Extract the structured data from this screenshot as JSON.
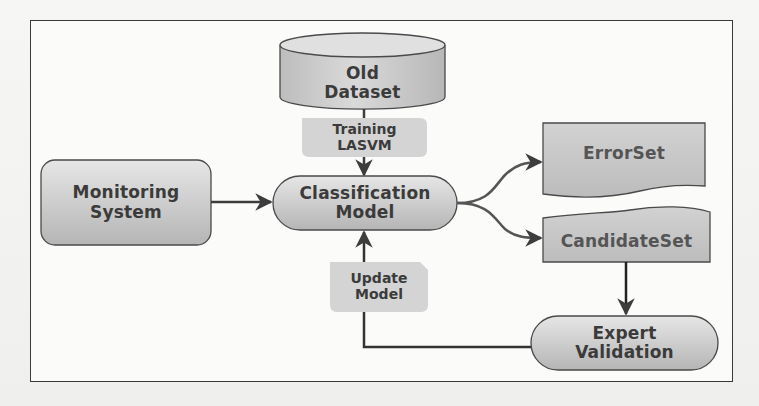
{
  "diagram": {
    "type": "flowchart",
    "nodes": {
      "old_dataset": {
        "line1": "Old",
        "line2": "Dataset",
        "shape": "cylinder"
      },
      "training": {
        "line1": "Training",
        "line2": "LASVM",
        "shape": "edge-label"
      },
      "monitoring": {
        "line1": "Monitoring",
        "line2": "System",
        "shape": "rounded-rectangle"
      },
      "classification": {
        "line1": "Classification",
        "line2": "Model",
        "shape": "stadium"
      },
      "errorset": {
        "line1": "ErrorSet",
        "shape": "document"
      },
      "candidateset": {
        "line1": "CandidateSet",
        "shape": "wavy-top-rectangle"
      },
      "expert": {
        "line1": "Expert",
        "line2": "Validation",
        "shape": "stadium"
      },
      "update": {
        "line1": "Update",
        "line2": "Model",
        "shape": "edge-label"
      }
    },
    "edges": [
      {
        "from": "Old Dataset",
        "to": "Classification Model",
        "label": "Training LASVM"
      },
      {
        "from": "Monitoring System",
        "to": "Classification Model"
      },
      {
        "from": "Classification Model",
        "to": "ErrorSet"
      },
      {
        "from": "Classification Model",
        "to": "CandidateSet"
      },
      {
        "from": "CandidateSet",
        "to": "Expert Validation"
      },
      {
        "from": "Expert Validation",
        "to": "Classification Model",
        "label": "Update Model"
      }
    ],
    "colors": {
      "node_fill_light": "#e2e2e2",
      "node_fill_dark": "#b8b8b8",
      "label_fill": "#d6d6d6",
      "stroke": "#4a4a4a",
      "text": "#3b3b3b",
      "frame": "#3a3a3a"
    }
  }
}
